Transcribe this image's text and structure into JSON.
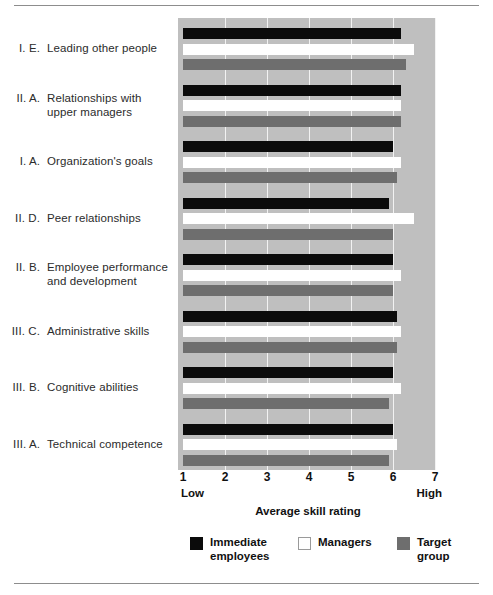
{
  "chart_data": {
    "type": "bar",
    "orientation": "horizontal",
    "title": "",
    "xlabel": "Average skill rating",
    "ylabel": "",
    "xlim": [
      1,
      7
    ],
    "xticks": [
      "1",
      "2",
      "3",
      "4",
      "5",
      "6",
      "7"
    ],
    "x_axis_low_label": "Low",
    "x_axis_high_label": "High",
    "grid": true,
    "legend_position": "bottom",
    "categories": [
      "I.  E.  Leading other people",
      "II.  A.  Relationships with upper managers",
      "I.  A.  Organization's goals",
      "II.  D.  Peer relationships",
      "II.  B.  Employee performance and development",
      "III.  C.  Administrative skills",
      "III.  B.  Cognitive abilities",
      "III.  A.  Technical competence"
    ],
    "series": [
      {
        "name": "Immediate employees",
        "color": "#0b0b0b",
        "values": [
          6.2,
          6.2,
          6.0,
          5.9,
          6.0,
          6.1,
          6.0,
          6.0
        ]
      },
      {
        "name": "Managers",
        "color": "#ffffff",
        "values": [
          6.5,
          6.2,
          6.2,
          6.5,
          6.2,
          6.2,
          6.2,
          6.1
        ]
      },
      {
        "name": "Target group",
        "color": "#6e6e6e",
        "values": [
          6.3,
          6.2,
          6.1,
          6.0,
          6.0,
          6.1,
          5.9,
          5.9
        ]
      }
    ]
  },
  "categories_rows": [
    {
      "num": "I.  E.",
      "line1": "Leading other people",
      "line2": ""
    },
    {
      "num": "II.  A.",
      "line1": "Relationships with",
      "line2": "upper managers"
    },
    {
      "num": "I.  A.",
      "line1": "Organization's goals",
      "line2": ""
    },
    {
      "num": "II.  D.",
      "line1": "Peer relationships",
      "line2": ""
    },
    {
      "num": "II.  B.",
      "line1": "Employee performance",
      "line2": "and development"
    },
    {
      "num": "III.  C.",
      "line1": "Administrative skills",
      "line2": ""
    },
    {
      "num": "III.  B.",
      "line1": "Cognitive abilities",
      "line2": ""
    },
    {
      "num": "III.  A.",
      "line1": "Technical competence",
      "line2": ""
    }
  ],
  "axis": {
    "ticks": [
      "1",
      "2",
      "3",
      "4",
      "5",
      "6",
      "7"
    ],
    "low": "Low",
    "high": "High",
    "title": "Average skill rating"
  },
  "legend": [
    {
      "label": "Immediate\nemployees",
      "key": "immediate"
    },
    {
      "label": "Managers",
      "key": "managers"
    },
    {
      "label": "Target group",
      "key": "target"
    }
  ],
  "colors": {
    "immediate": "#0b0b0b",
    "managers": "#ffffff",
    "target": "#6e6e6e",
    "plot_background": "#bfbfbf",
    "gridline": "#f2f2f2",
    "rule": "#8d8d8d"
  }
}
